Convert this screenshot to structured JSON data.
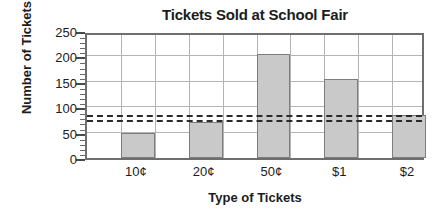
{
  "chart_data": {
    "type": "bar",
    "title": "Tickets Sold at School Fair",
    "xlabel": "Type of Tickets",
    "ylabel": "Number of Tickets",
    "categories": [
      "10¢",
      "20¢",
      "50¢",
      "$1",
      "$2"
    ],
    "values": [
      50,
      70,
      205,
      155,
      85
    ],
    "ylim": [
      0,
      250
    ],
    "ytick_values": [
      0,
      50,
      100,
      150,
      200,
      250
    ],
    "ytick_labels": [
      "0",
      "50",
      "100",
      "150",
      "200",
      "250"
    ],
    "ytick_minor_step": 10,
    "grid": true,
    "legend": "none",
    "bar_color": "#c9c9c9",
    "bar_edge_color": "#7d7d7d",
    "grid_color": "#b4b4b4",
    "axis_color": "#6e6e6e",
    "reference_lines": [
      {
        "name": "upper-dashed-line",
        "value": 80,
        "style": "dashed",
        "color": "#2a2a2a"
      },
      {
        "name": "lower-dashed-line",
        "value": 70,
        "style": "dashed",
        "color": "#2a2a2a"
      }
    ]
  }
}
